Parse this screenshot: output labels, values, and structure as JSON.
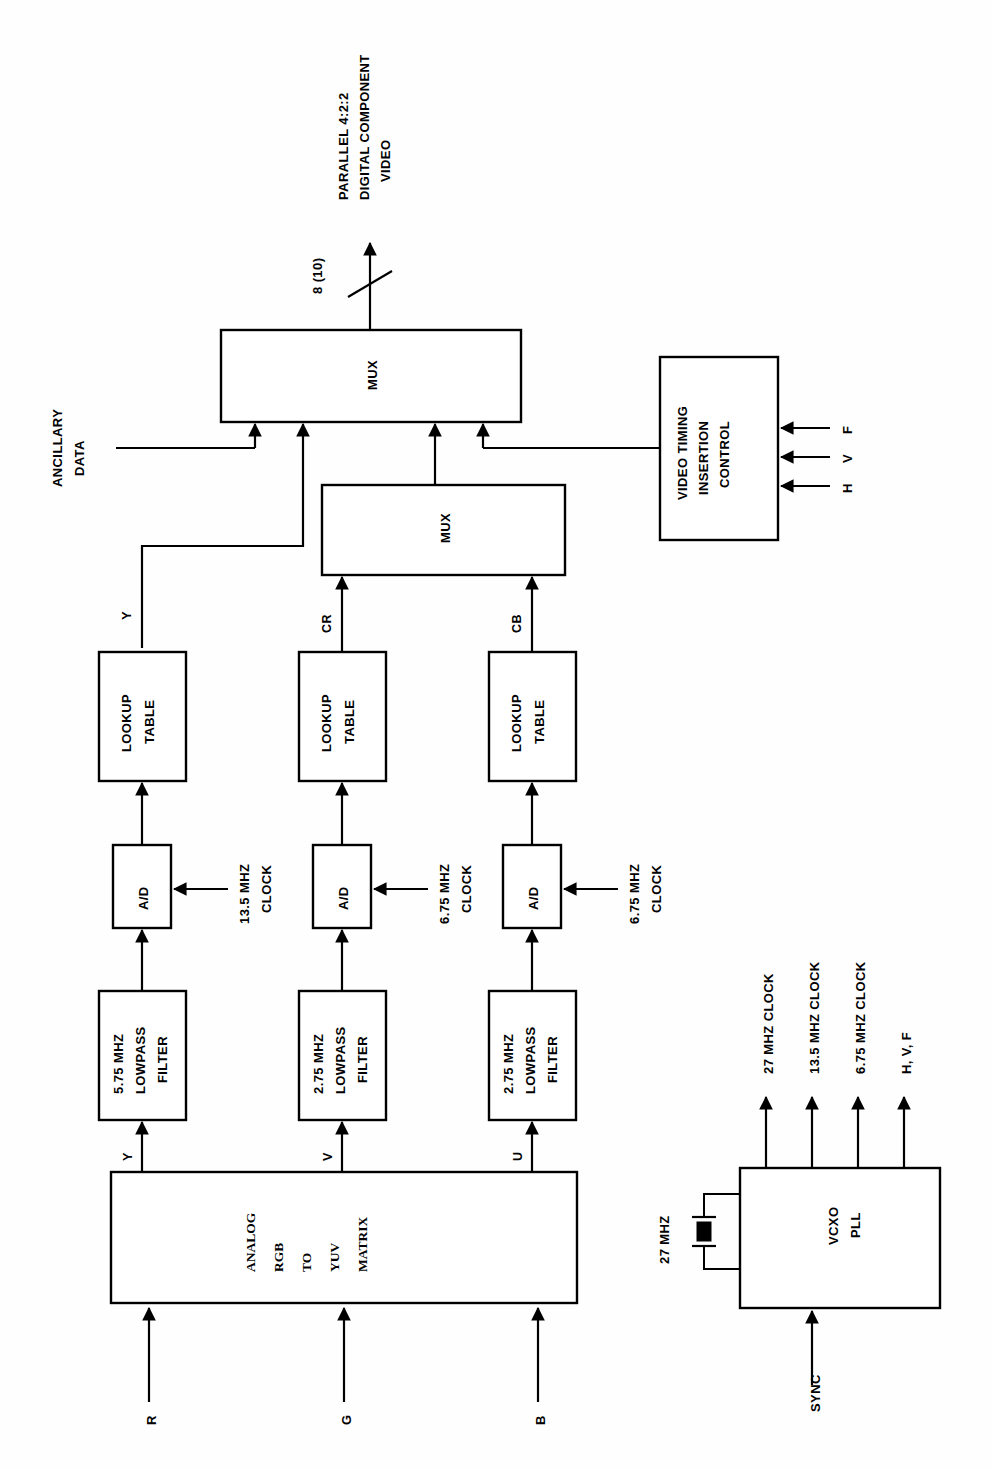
{
  "diagram": {
    "orientation": "rotated-90-ccw",
    "output_label_line1": "PARALLEL 4:2:2",
    "output_label_line2": "DIGITAL COMPONENT",
    "output_label_line3": "VIDEO",
    "bus_width_label": "8 (10)",
    "ancillary_line1": "ANCILLARY",
    "ancillary_line2": "DATA",
    "blocks": {
      "mux_output": {
        "label": "MUX"
      },
      "mux_chroma": {
        "label": "MUX"
      },
      "video_timing": {
        "line1": "VIDEO TIMING",
        "line2": "INSERTION",
        "line3": "CONTROL"
      },
      "lookup_y": {
        "line1": "LOOKUP",
        "line2": "TABLE"
      },
      "lookup_cr": {
        "line1": "LOOKUP",
        "line2": "TABLE"
      },
      "lookup_cb": {
        "line1": "LOOKUP",
        "line2": "TABLE"
      },
      "ad_y": {
        "label": "A/D"
      },
      "ad_cr": {
        "label": "A/D"
      },
      "ad_cb": {
        "label": "A/D"
      },
      "lpf_y": {
        "line1": "5.75 MHZ",
        "line2": "LOWPASS",
        "line3": "FILTER"
      },
      "lpf_v": {
        "line1": "2.75 MHZ",
        "line2": "LOWPASS",
        "line3": "FILTER"
      },
      "lpf_u": {
        "line1": "2.75 MHZ",
        "line2": "LOWPASS",
        "line3": "FILTER"
      },
      "matrix": {
        "line1": "ANALOG",
        "line2": "RGB",
        "line3": "TO",
        "line4": "YUV",
        "line5": "MATRIX"
      },
      "vcxo_pll": {
        "line1": "VCXO",
        "line2": "PLL"
      }
    },
    "signals": {
      "timing_inputs": [
        "H",
        "V",
        "F"
      ],
      "chroma_cr": "CR",
      "chroma_cb": "CB",
      "luma_y": "Y",
      "matrix_out_y": "Y",
      "matrix_out_v": "V",
      "matrix_out_u": "U",
      "rgb_inputs": [
        "R",
        "G",
        "B"
      ]
    },
    "clocks": {
      "ad_y_clock_line1": "13.5 MHZ",
      "ad_y_clock_line2": "CLOCK",
      "ad_cr_clock_line1": "6.75 MHZ",
      "ad_cr_clock_line2": "CLOCK",
      "ad_cb_clock_line1": "6.75 MHZ",
      "ad_cb_clock_line2": "CLOCK"
    },
    "pll": {
      "crystal_label": "27 MHZ",
      "sync_input": "SYNC",
      "outputs": [
        "27 MHZ CLOCK",
        "13.5 MHZ CLOCK",
        "6.75 MHZ CLOCK",
        "H, V, F"
      ]
    },
    "colors": {
      "stroke": "#000000",
      "background": "#ffffff",
      "fill": "#ffffff"
    }
  }
}
